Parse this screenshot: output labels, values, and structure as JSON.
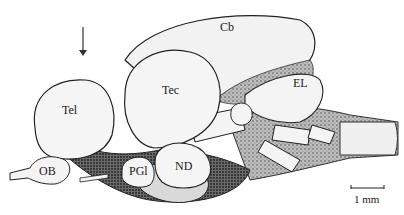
{
  "figure": {
    "labels": {
      "cb": "Cb",
      "tec": "Tec",
      "tel": "Tel",
      "el": "EL",
      "ob": "OB",
      "pgi": "PGl",
      "nd": "ND"
    },
    "scale_bar": {
      "label": "1 mm"
    },
    "arrow": {
      "direction": "down"
    },
    "colors": {
      "ink": "#1a1a1a",
      "fill": "#f4f4f4",
      "shade": "#8a8a8a",
      "dark_shade": "#4a4a4a"
    }
  }
}
